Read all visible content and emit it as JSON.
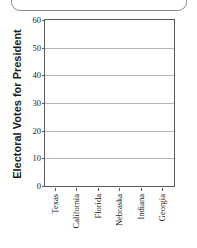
{
  "frame": {
    "shape": "rounded-rectangle-fragment"
  },
  "chart_data": {
    "type": "bar",
    "title": "",
    "subtitle": "",
    "xlabel": "",
    "ylabel": "Electoral Votes for President",
    "categories": [
      "Texas",
      "California",
      "Florida",
      "Nebraska",
      "Indiana",
      "Georgia"
    ],
    "values": [
      null,
      null,
      null,
      null,
      null,
      null
    ],
    "series": [
      {
        "name": "Electoral Votes",
        "values": [
          null,
          null,
          null,
          null,
          null,
          null
        ]
      }
    ],
    "ylim": [
      0,
      60
    ],
    "yticks": [
      0,
      10,
      20,
      30,
      40,
      50,
      60
    ],
    "ytick_labels": [
      "0",
      "10",
      "20",
      "30",
      "40",
      "50",
      "60"
    ],
    "grid": true,
    "grid_axis": "y",
    "legend": false,
    "legend_position": "none",
    "annotations": [],
    "note": "Blank plotting grid - no bars are drawn in the plot area",
    "colors": {
      "axis": "#5b5b5b",
      "gridline": "#b5b5b5",
      "text": "#1a1a1a",
      "background": "#ffffff",
      "bar": "#4a4a4a"
    }
  }
}
